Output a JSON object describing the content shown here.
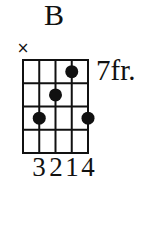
{
  "chord": {
    "name": "B",
    "fret_label": "7fr.",
    "strings": 5,
    "frets_shown": 4,
    "muted_strings": [
      1
    ],
    "mute_symbol": "×",
    "dots": [
      {
        "string": 4,
        "fret": 1,
        "finger": "1"
      },
      {
        "string": 3,
        "fret": 2,
        "finger": "2"
      },
      {
        "string": 2,
        "fret": 3,
        "finger": "3"
      },
      {
        "string": 5,
        "fret": 3,
        "finger": "4"
      }
    ],
    "fingering": [
      "",
      "3",
      "2",
      "1",
      "4"
    ],
    "fingering_text": "3214"
  },
  "colors": {
    "ink": "#111111",
    "background": "#ffffff"
  }
}
